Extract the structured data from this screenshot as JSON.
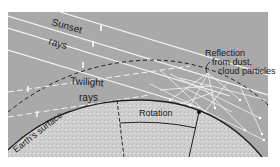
{
  "diagram": {
    "labels": {
      "sunset": "Sunset",
      "sunset_rays": "rays",
      "twilight": "Twilight",
      "twilight_rays": "rays",
      "reflection_line1": "Reflection",
      "reflection_line2": "from dust,",
      "reflection_line3": "cloud particles",
      "rotation": "Rotation",
      "earth_surface": "Earth's surface"
    },
    "colors": {
      "sky": "#a9a9a9",
      "earth": "#d0d0d0",
      "rays": "#f4f4f4",
      "outline": "#1e1e1e"
    }
  }
}
